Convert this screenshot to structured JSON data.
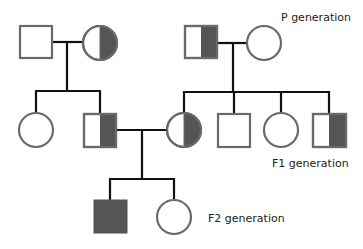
{
  "diagram": {
    "type": "pedigree",
    "colors": {
      "affected_fill": "#555555",
      "outline": "#6a6a6a",
      "line": "#111111",
      "background": "#ffffff"
    },
    "labels": {
      "p_generation": "P generation",
      "f1_generation": "F1 generation",
      "f2_generation": "F2 generation"
    },
    "generations": [
      {
        "name": "P generation",
        "individuals": [
          {
            "id": "P1",
            "sex": "male",
            "status": "unaffected"
          },
          {
            "id": "P2",
            "sex": "female",
            "status": "carrier"
          },
          {
            "id": "P3",
            "sex": "male",
            "status": "carrier"
          },
          {
            "id": "P4",
            "sex": "female",
            "status": "unaffected"
          }
        ]
      },
      {
        "name": "F1 generation",
        "individuals": [
          {
            "id": "F1-1",
            "sex": "female",
            "status": "unaffected",
            "parents": [
              "P1",
              "P2"
            ]
          },
          {
            "id": "F1-2",
            "sex": "male",
            "status": "carrier",
            "parents": [
              "P1",
              "P2"
            ]
          },
          {
            "id": "F1-3",
            "sex": "female",
            "status": "carrier",
            "parents": [
              "P3",
              "P4"
            ]
          },
          {
            "id": "F1-4",
            "sex": "male",
            "status": "unaffected",
            "parents": [
              "P3",
              "P4"
            ]
          },
          {
            "id": "F1-5",
            "sex": "female",
            "status": "unaffected",
            "parents": [
              "P3",
              "P4"
            ]
          },
          {
            "id": "F1-6",
            "sex": "male",
            "status": "carrier",
            "parents": [
              "P3",
              "P4"
            ]
          }
        ]
      },
      {
        "name": "F2 generation",
        "individuals": [
          {
            "id": "F2-1",
            "sex": "male",
            "status": "affected",
            "parents": [
              "F1-2",
              "F1-3"
            ]
          },
          {
            "id": "F2-2",
            "sex": "female",
            "status": "unaffected",
            "parents": [
              "F1-2",
              "F1-3"
            ]
          }
        ]
      }
    ],
    "matings": [
      [
        "P1",
        "P2"
      ],
      [
        "P3",
        "P4"
      ],
      [
        "F1-2",
        "F1-3"
      ]
    ]
  }
}
